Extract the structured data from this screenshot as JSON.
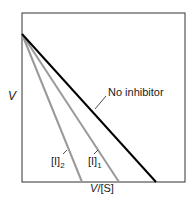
{
  "chart_data": {
    "type": "line",
    "title": "",
    "xlabel": "V/[S]",
    "ylabel": "V",
    "grid": false,
    "legend": "inline labels",
    "plot_box": {
      "x0": 22,
      "y0": 13,
      "x1": 185,
      "y1": 182
    },
    "series": [
      {
        "name": "No inhibitor",
        "color": "#000000",
        "width": 2,
        "points": [
          [
            22,
            34
          ],
          [
            156,
            182
          ]
        ],
        "label_pos": [
          108,
          96
        ],
        "leader": [
          [
            95,
            109
          ],
          [
            106,
            96
          ]
        ]
      },
      {
        "name": "[I]1",
        "sub": "1",
        "base": "[I]",
        "color": "#999999",
        "width": 2,
        "points": [
          [
            22,
            34
          ],
          [
            119,
            182
          ]
        ],
        "label_pos": [
          88,
          165
        ],
        "leader": [
          [
            94,
            154
          ],
          [
            98,
            150
          ]
        ]
      },
      {
        "name": "[I]2",
        "sub": "2",
        "base": "[I]",
        "color": "#999999",
        "width": 2,
        "points": [
          [
            22,
            34
          ],
          [
            82,
            182
          ]
        ],
        "label_pos": [
          51,
          165
        ],
        "leader": [
          [
            63,
            154
          ],
          [
            67,
            150
          ]
        ]
      }
    ],
    "axis_labels": {
      "x": {
        "text": "V/[S]",
        "x": 102,
        "y": 192
      },
      "y": {
        "text": "V",
        "x": 8,
        "y": 100
      }
    }
  }
}
